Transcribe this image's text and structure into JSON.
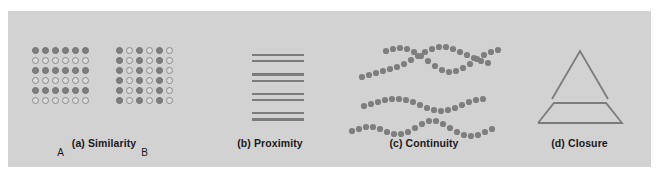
{
  "figure": {
    "background_color": "#ffffff",
    "panel_color": "#d2d2d2",
    "mark_color": "#7e7e7e",
    "line_color": "#7c7c7c",
    "text_color": "#1a1a1a",
    "panels": [
      {
        "id": "similarity",
        "caption": "(a) Similarity"
      },
      {
        "id": "proximity",
        "caption": "(b) Proximity"
      },
      {
        "id": "continuity",
        "caption": "(c) Continuity"
      },
      {
        "id": "closure",
        "caption": "(d) Closure"
      }
    ]
  },
  "similarity": {
    "caption": "(a) Similarity",
    "groups": [
      {
        "label": "A",
        "grouping": "rows",
        "rows": 6,
        "cols": 6,
        "pattern": [
          [
            "filled",
            "filled",
            "filled",
            "filled",
            "filled",
            "filled"
          ],
          [
            "open",
            "open",
            "open",
            "open",
            "open",
            "open"
          ],
          [
            "filled",
            "filled",
            "filled",
            "filled",
            "filled",
            "filled"
          ],
          [
            "open",
            "open",
            "open",
            "open",
            "open",
            "open"
          ],
          [
            "filled",
            "filled",
            "filled",
            "filled",
            "filled",
            "filled"
          ],
          [
            "open",
            "open",
            "open",
            "open",
            "open",
            "open"
          ]
        ]
      },
      {
        "label": "B",
        "grouping": "columns",
        "rows": 6,
        "cols": 6,
        "pattern": [
          [
            "filled",
            "open",
            "filled",
            "open",
            "filled",
            "open"
          ],
          [
            "filled",
            "open",
            "filled",
            "open",
            "filled",
            "open"
          ],
          [
            "filled",
            "open",
            "filled",
            "open",
            "filled",
            "open"
          ],
          [
            "filled",
            "open",
            "filled",
            "open",
            "filled",
            "open"
          ],
          [
            "filled",
            "open",
            "filled",
            "open",
            "filled",
            "open"
          ],
          [
            "filled",
            "open",
            "filled",
            "open",
            "filled",
            "open"
          ]
        ]
      }
    ]
  },
  "proximity": {
    "caption": "(b) Proximity",
    "pair_count": 4,
    "lines_per_pair": 2,
    "total_lines": 8
  },
  "continuity": {
    "caption": "(c) Continuity",
    "curve_count": 4,
    "dot_radius": 3.1,
    "curves": [
      {
        "name": "curve-1",
        "points": [
          [
            22,
            66
          ],
          [
            29,
            64
          ],
          [
            36,
            62
          ],
          [
            43,
            60
          ],
          [
            50,
            58
          ],
          [
            57,
            56
          ],
          [
            64,
            53
          ],
          [
            71,
            49
          ],
          [
            78,
            45
          ],
          [
            85,
            41
          ],
          [
            92,
            38
          ],
          [
            99,
            36
          ],
          [
            106,
            36
          ],
          [
            113,
            38
          ],
          [
            120,
            41
          ],
          [
            127,
            44
          ],
          [
            134,
            47
          ],
          [
            141,
            50
          ],
          [
            148,
            52
          ]
        ]
      },
      {
        "name": "curve-2",
        "points": [
          [
            46,
            40
          ],
          [
            53,
            38
          ],
          [
            60,
            37
          ],
          [
            67,
            38
          ],
          [
            74,
            41
          ],
          [
            81,
            45
          ],
          [
            88,
            50
          ],
          [
            95,
            55
          ],
          [
            102,
            59
          ],
          [
            109,
            61
          ],
          [
            116,
            60
          ],
          [
            123,
            57
          ],
          [
            130,
            53
          ],
          [
            137,
            48
          ],
          [
            144,
            44
          ],
          [
            151,
            41
          ],
          [
            158,
            39
          ]
        ]
      },
      {
        "name": "curve-3",
        "points": [
          [
            24,
            95
          ],
          [
            31,
            93
          ],
          [
            38,
            91
          ],
          [
            45,
            89
          ],
          [
            52,
            88
          ],
          [
            59,
            88
          ],
          [
            66,
            89
          ],
          [
            73,
            91
          ],
          [
            80,
            94
          ],
          [
            87,
            97
          ],
          [
            94,
            99
          ],
          [
            101,
            100
          ],
          [
            108,
            99
          ],
          [
            115,
            97
          ],
          [
            122,
            94
          ],
          [
            129,
            91
          ],
          [
            136,
            89
          ],
          [
            143,
            88
          ]
        ]
      },
      {
        "name": "curve-4",
        "points": [
          [
            12,
            120
          ],
          [
            19,
            118
          ],
          [
            26,
            116
          ],
          [
            33,
            116
          ],
          [
            40,
            118
          ],
          [
            47,
            121
          ],
          [
            54,
            123
          ],
          [
            61,
            123
          ],
          [
            68,
            121
          ],
          [
            75,
            117
          ],
          [
            82,
            113
          ],
          [
            89,
            110
          ],
          [
            96,
            110
          ],
          [
            103,
            113
          ],
          [
            110,
            117
          ],
          [
            117,
            121
          ],
          [
            124,
            124
          ],
          [
            131,
            125
          ],
          [
            138,
            124
          ],
          [
            145,
            121
          ],
          [
            152,
            118
          ]
        ]
      }
    ]
  },
  "closure": {
    "caption": "(d) Closure",
    "shape": "incomplete-triangle",
    "stroke_width": 1.8,
    "apex": {
      "name": "triangle-apex",
      "points": "44,88 72,40 100,88"
    },
    "base": {
      "name": "triangle-base",
      "points": "30,112 46,92 98,92 114,112 30,112"
    },
    "base_open_top": true
  }
}
